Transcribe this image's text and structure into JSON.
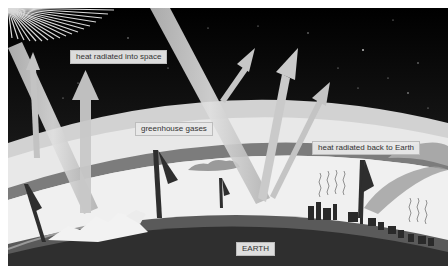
{
  "diagram": {
    "labels": {
      "space": "heat radiated into space",
      "gases": "greenhouse gases",
      "back": "heat radiated back to Earth",
      "earth": "EARTH"
    },
    "icons": {
      "sun": "sun-rays-icon",
      "incoming": "sunlight-beam-icon",
      "outgoing": "heat-arrow-up-icon",
      "returning": "heat-arrow-down-icon",
      "factories": "industry-skyline-icon",
      "heat_waves": "heat-wave-icon",
      "clouds": "cloud-icon",
      "mountains": "snowy-mountain-icon"
    },
    "colors": {
      "space_top": "#000000",
      "space_bottom": "#3a3a3a",
      "atmosphere_light": "#e6e6e6",
      "atmosphere_band": "#8a8a8a",
      "earth_dark": "#2b2b2b",
      "earth_mid": "#5c5c5c",
      "beam": "#cfcfcf",
      "arrow_dark": "#2e2e2e"
    }
  }
}
